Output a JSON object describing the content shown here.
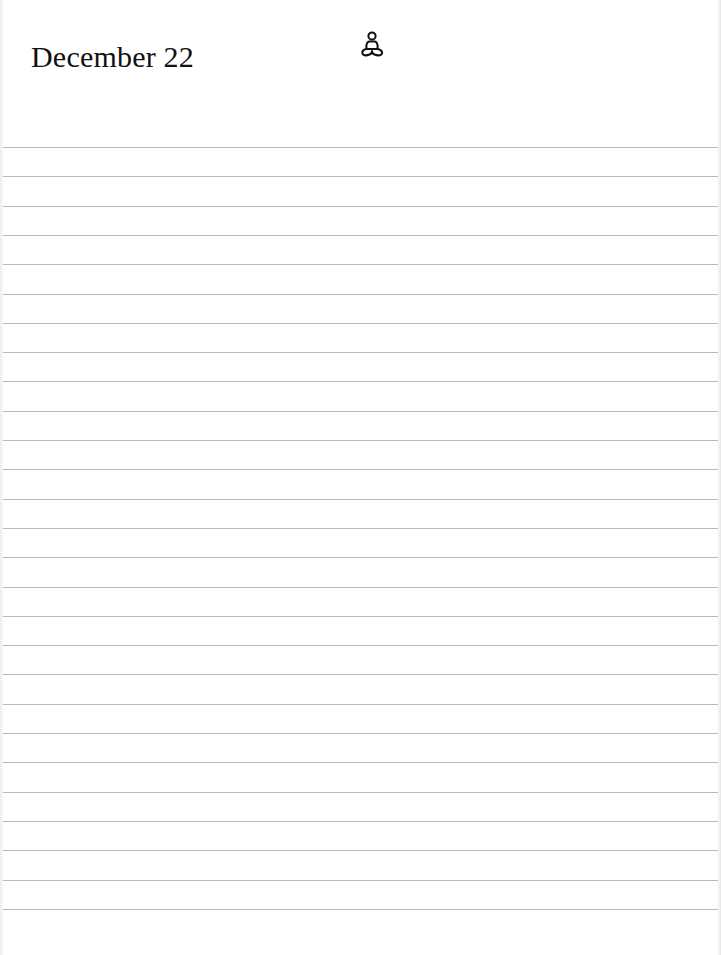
{
  "page": {
    "date_title": "December 22",
    "header_icon": "meditation-figure-icon",
    "ruled_lines": {
      "count": 27,
      "first_y": 147,
      "spacing": 29.3,
      "color": "#b9b9b9"
    },
    "background_color": "#ffffff",
    "text_color": "#111111"
  }
}
